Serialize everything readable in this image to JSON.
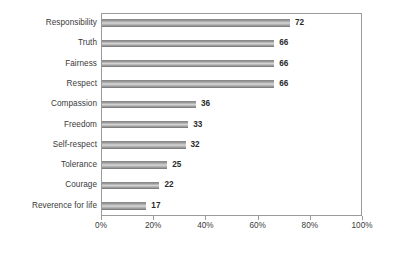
{
  "chart_data": {
    "type": "bar",
    "orientation": "horizontal",
    "title": "",
    "subtitle": "",
    "xlabel": "",
    "ylabel": "",
    "categories": [
      "Responsibility",
      "Truth",
      "Fairness",
      "Respect",
      "Compassion",
      "Freedom",
      "Self-respect",
      "Tolerance",
      "Courage",
      "Reverence for life"
    ],
    "values": [
      72,
      66,
      66,
      66,
      36,
      33,
      32,
      25,
      22,
      17
    ],
    "value_labels": [
      "72",
      "66",
      "66",
      "66",
      "36",
      "33",
      "32",
      "25",
      "22",
      "17"
    ],
    "xlim": [
      0,
      100
    ],
    "xticks": [
      0,
      20,
      40,
      60,
      80,
      100
    ],
    "xtick_labels": [
      "0%",
      "20%",
      "40%",
      "60%",
      "80%",
      "100%"
    ],
    "grid": false,
    "legend": null,
    "unit": "%",
    "bar_color": "#c0c0c0",
    "bar_edge_color": "#8a8a8a",
    "axis_color": "#9a9a9a",
    "text_color": "#3a3a3a",
    "background": "#ffffff"
  }
}
